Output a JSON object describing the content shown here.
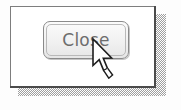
{
  "scene": {
    "kind": "dialog-with-cursor-illustration",
    "background_color": "#fdfdfd"
  },
  "dialog": {
    "name": "close-dialog",
    "background_color": "#ffffff",
    "border_color": "#7d7d7d",
    "shadow_color": "#9b9b9b",
    "shadow_style": "dithered-halftone"
  },
  "button": {
    "label": "Close",
    "text_color": "#6d6d6d",
    "face_color": "#f1f1f1",
    "border_color": "#8a8a8a",
    "state": "normal",
    "shape": "rounded-rectangle"
  },
  "cursor": {
    "icon": "arrow-pointer-icon",
    "fill_color": "#ffffff",
    "outline_color": "#1a1a1a",
    "hotspot_x": 93,
    "hotspot_y": 40
  }
}
